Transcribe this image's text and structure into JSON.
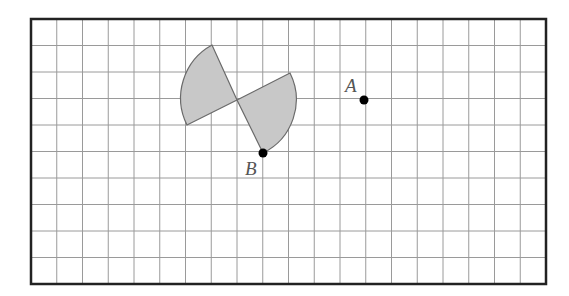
{
  "diagram": {
    "type": "grid-rotation",
    "grid": {
      "cols": 20,
      "rows": 10,
      "left": 31,
      "top": 19,
      "width": 515,
      "height": 265
    },
    "colors": {
      "shape_fill": "#c8c8c8",
      "shape_stroke": "#6a6a6a",
      "grid": "#9a9a9a",
      "border": "#222222"
    },
    "points": [
      {
        "id": "A",
        "label": "A",
        "x": 364,
        "y": 100,
        "label_x": 345,
        "label_y": 92
      },
      {
        "id": "B",
        "label": "B",
        "x": 263,
        "y": 153,
        "label_x": 245,
        "label_y": 175
      }
    ],
    "shape": {
      "description": "Two shaded circular sectors meeting at a common vertex",
      "center": [
        237,
        100
      ],
      "sectors": [
        {
          "name": "upper-left-sector",
          "p1": [
            212,
            45
          ],
          "p2": [
            187,
            125
          ]
        },
        {
          "name": "lower-right-sector",
          "p1": [
            290,
            73
          ],
          "p2": [
            263,
            153
          ]
        }
      ]
    }
  }
}
